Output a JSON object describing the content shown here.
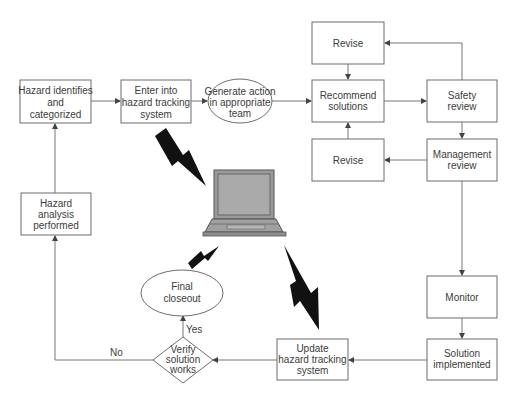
{
  "diagram": {
    "type": "flowchart",
    "nodes": {
      "hazard_identifies": {
        "shape": "rect",
        "lines": [
          "Hazard identifies",
          "and",
          "categorized"
        ]
      },
      "enter_tracking": {
        "shape": "rect",
        "lines": [
          "Enter into",
          "hazard tracking",
          "system"
        ]
      },
      "generate_action": {
        "shape": "ellipse",
        "lines": [
          "Generate action",
          "in appropriate",
          "team"
        ]
      },
      "revise_top": {
        "shape": "rect",
        "lines": [
          "Revise"
        ]
      },
      "recommend_solutions": {
        "shape": "rect",
        "lines": [
          "Recommend",
          "solutions"
        ]
      },
      "revise_bottom": {
        "shape": "rect",
        "lines": [
          "Revise"
        ]
      },
      "safety_review": {
        "shape": "rect",
        "lines": [
          "Safety",
          "review"
        ]
      },
      "management_review": {
        "shape": "rect",
        "lines": [
          "Management",
          "review"
        ]
      },
      "monitor": {
        "shape": "rect",
        "lines": [
          "Monitor"
        ]
      },
      "solution_implemented": {
        "shape": "rect",
        "lines": [
          "Solution",
          "implemented"
        ]
      },
      "update_tracking": {
        "shape": "rect",
        "lines": [
          "Update",
          "hazard tracking",
          "system"
        ]
      },
      "verify_solution": {
        "shape": "diamond",
        "lines": [
          "Verify",
          "solution",
          "works"
        ]
      },
      "final_closeout": {
        "shape": "ellipse",
        "lines": [
          "Final",
          "closeout"
        ]
      },
      "hazard_analysis": {
        "shape": "rect",
        "lines": [
          "Hazard",
          "analysis",
          "performed"
        ]
      }
    },
    "edges": [
      {
        "from": "hazard_identifies",
        "to": "enter_tracking"
      },
      {
        "from": "enter_tracking",
        "to": "generate_action"
      },
      {
        "from": "generate_action",
        "to": "recommend_solutions"
      },
      {
        "from": "recommend_solutions",
        "to": "safety_review"
      },
      {
        "from": "safety_review",
        "to": "revise_top"
      },
      {
        "from": "revise_top",
        "to": "recommend_solutions"
      },
      {
        "from": "safety_review",
        "to": "management_review"
      },
      {
        "from": "management_review",
        "to": "revise_bottom"
      },
      {
        "from": "revise_bottom",
        "to": "recommend_solutions"
      },
      {
        "from": "management_review",
        "to": "monitor"
      },
      {
        "from": "monitor",
        "to": "solution_implemented"
      },
      {
        "from": "solution_implemented",
        "to": "update_tracking"
      },
      {
        "from": "update_tracking",
        "to": "verify_solution"
      },
      {
        "from": "verify_solution",
        "to": "final_closeout",
        "label": "Yes"
      },
      {
        "from": "verify_solution",
        "to": "hazard_analysis",
        "label": "No"
      },
      {
        "from": "hazard_analysis",
        "to": "hazard_identifies"
      }
    ],
    "edge_labels": {
      "yes": "Yes",
      "no": "No"
    },
    "decorations": [
      "laptop-icon",
      "lightning-bolt-icon",
      "lightning-bolt-icon",
      "lightning-bolt-icon"
    ]
  },
  "colors": {
    "stroke": "#6d6d6d",
    "text": "#3c3c3c",
    "bolt": "#111111",
    "laptop_body": "#9a9a9a",
    "laptop_screen": "#a8a8a8"
  }
}
